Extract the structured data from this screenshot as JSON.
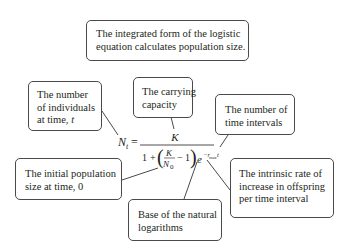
{
  "title_box": {
    "lines": [
      "The integrated form of the logistic",
      "equation calculates population size."
    ]
  },
  "equation": {
    "lhs": "N",
    "lhs_sub": "t",
    "equals": "=",
    "numerator": "K",
    "denominator": {
      "one": "1",
      "plus": "+",
      "inner_num": "K",
      "inner_den": "N",
      "inner_den_sub": "0",
      "minus": "−",
      "inner_one": "1",
      "exp_base": "e",
      "exp_neg": "−r",
      "exp_sub": "max",
      "exp_t": "t"
    }
  },
  "callouts": [
    {
      "id": "nt",
      "lines": [
        "The number",
        "of individuals",
        "at time, "
      ],
      "italic_tail": "t"
    },
    {
      "id": "k",
      "lines": [
        "The carrying",
        "capacity"
      ]
    },
    {
      "id": "t",
      "lines": [
        "The number of",
        "time intervals"
      ]
    },
    {
      "id": "n0",
      "lines": [
        "The initial population",
        "size at time, 0"
      ]
    },
    {
      "id": "e",
      "lines": [
        "Base of the natural",
        "logarithms"
      ]
    },
    {
      "id": "r",
      "lines": [
        "The intrinsic rate of",
        "increase in offspring",
        "per time interval"
      ]
    }
  ],
  "colors": {
    "border": "#4a4a4a",
    "text": "#231f20",
    "background": "#ffffff"
  }
}
